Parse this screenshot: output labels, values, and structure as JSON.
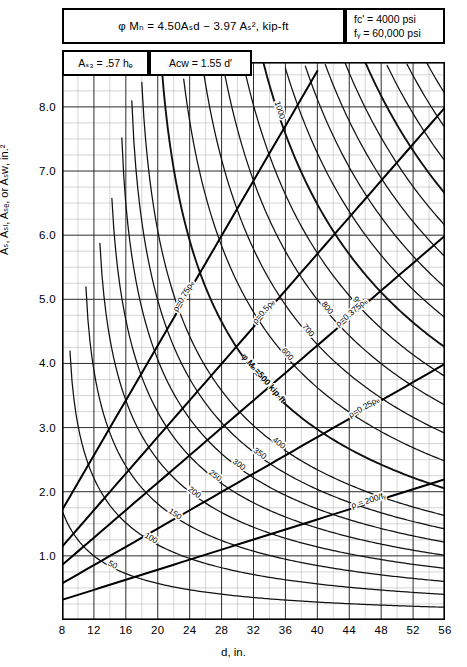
{
  "header": {
    "equation": "φ Mₙ = 4.50Aₛd − 3.97 Aₛ²,  kip-ft",
    "fc_line": "fᴄ' = 4000 psi",
    "fy_line": "fᵧ = 60,000 psi",
    "as3": "Aₛ₃ = .57 hₑ",
    "acw": "Aᴄᴡ = 1.55 d'"
  },
  "axes": {
    "ylabel": "Aₛ, Aₛₗ, Aₛₑ, or Aₛᴡ, in.²",
    "xlabel": "d, in.",
    "yticks": [
      "1.0",
      "2.0",
      "3.0",
      "4.0",
      "5.0",
      "6.0",
      "7.0",
      "8.0"
    ],
    "xticks": [
      "8",
      "12",
      "16",
      "20",
      "24",
      "28",
      "32",
      "36",
      "40",
      "44",
      "48",
      "52",
      "56"
    ]
  },
  "annotations": {
    "rho75": "ρ=0.75ρₑ",
    "rho50": "ρ=0.5ρₑ",
    "rho375": "ρ=0.375ρₑ",
    "rho25": "ρ=0.25ρₑ",
    "rho_min": "ρ = 200/fᵧ",
    "moment_caption": "φ Mₙ=500 kip-ft"
  },
  "chart_data": {
    "type": "line",
    "title": "φ Mₙ = 4.50Aₛd − 3.97 Aₛ²,  kip-ft",
    "xlabel": "d, in.",
    "ylabel": "Aₛ, Aₛₗ, Aₛₑ, or Aₛᴡ, in.²",
    "xlim": [
      8,
      56
    ],
    "ylim": [
      0,
      8.7
    ],
    "xmajor": 4,
    "xminor": 2,
    "ymajor": 1.0,
    "yminor": 0.25,
    "grid": true,
    "legend": "none",
    "material": {
      "fc_psi": 4000,
      "fy_psi": 60000
    },
    "coefficients": {
      "a": 4.5,
      "b": 3.97
    },
    "moment_contours": {
      "label_unit": "kip-ft",
      "values": [
        50,
        100,
        150,
        200,
        250,
        300,
        350,
        400,
        500,
        600,
        700,
        800,
        900,
        1000,
        1100,
        1200,
        1300,
        1400,
        1500,
        1600,
        1700,
        1800
      ],
      "labeled": [
        "50",
        "100",
        "150",
        "200",
        "250",
        "300",
        "350",
        "400",
        "φ Mₙ=500 kip-ft",
        "600",
        "700",
        "800",
        "900",
        "1000",
        "1100",
        "1200",
        "1300",
        "1400",
        "1500",
        "1600",
        "1700",
        "1800"
      ],
      "equation": "As = (4.50*d - sqrt((4.50*d)^2 - 4*3.97*M)) / (2*3.97)"
    },
    "rho_lines": [
      {
        "name": "ρ=0.75ρₑ",
        "slope": 0.214,
        "kind": "ray"
      },
      {
        "name": "ρ=0.5ρₑ",
        "slope": 0.1427,
        "kind": "ray"
      },
      {
        "name": "ρ=0.375ρₑ",
        "slope": 0.107,
        "kind": "ray"
      },
      {
        "name": "ρ=0.25ρₑ",
        "slope": 0.0713,
        "kind": "ray"
      },
      {
        "name": "ρ = 200/fᵧ",
        "slope": 0.0392,
        "kind": "ray"
      }
    ]
  }
}
